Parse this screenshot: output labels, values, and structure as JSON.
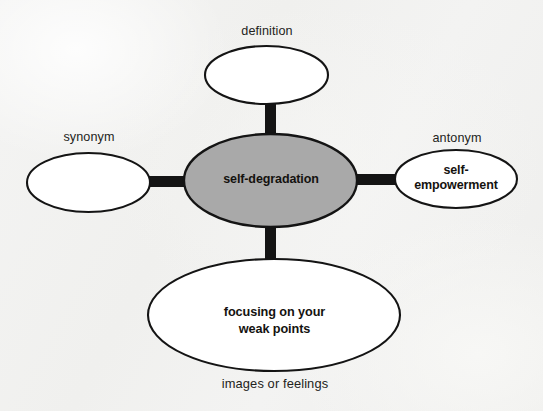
{
  "diagram": {
    "type": "word-web",
    "background_color": "#f2f2f1",
    "center": {
      "id": "center-node",
      "text": "self-degradation",
      "fill": "#a9a9a9",
      "stroke": "#141414",
      "cx": 270.5,
      "cy": 180.5,
      "rx": 86.5,
      "ry": 46.5
    },
    "nodes": [
      {
        "id": "definition-node",
        "label": "definition",
        "label_position": "above",
        "text": "",
        "fill": "#ffffff",
        "stroke": "#141414",
        "cx": 266.5,
        "cy": 75,
        "rx": 61.5,
        "ry": 29
      },
      {
        "id": "synonym-node",
        "label": "synonym",
        "label_position": "above",
        "text": "",
        "fill": "#ffffff",
        "stroke": "#141414",
        "cx": 88.5,
        "cy": 182.5,
        "rx": 61.5,
        "ry": 29.5
      },
      {
        "id": "antonym-node",
        "label": "antonym",
        "label_position": "above",
        "text": "self-\nempowerment",
        "fill": "#ffffff",
        "stroke": "#141414",
        "cx": 456,
        "cy": 179,
        "rx": 61,
        "ry": 29
      },
      {
        "id": "examples-node",
        "label": "images or feelings",
        "label_position": "below",
        "text": "focusing on your\nweak points",
        "fill": "#ffffff",
        "stroke": "#141414",
        "cx": 274,
        "cy": 315,
        "rx": 126,
        "ry": 56
      }
    ],
    "connectors": [
      {
        "id": "connector-top",
        "orientation": "vertical",
        "x": 265,
        "y": 100,
        "width": 11,
        "height": 38,
        "color": "#141414"
      },
      {
        "id": "connector-bottom",
        "orientation": "vertical",
        "x": 265,
        "y": 222,
        "width": 11,
        "height": 42,
        "color": "#141414"
      },
      {
        "id": "connector-left",
        "orientation": "horizontal",
        "x": 144,
        "y": 176,
        "width": 46,
        "height": 11,
        "color": "#141414"
      },
      {
        "id": "connector-right",
        "orientation": "horizontal",
        "x": 352,
        "y": 174,
        "width": 48,
        "height": 11,
        "color": "#141414"
      }
    ]
  }
}
